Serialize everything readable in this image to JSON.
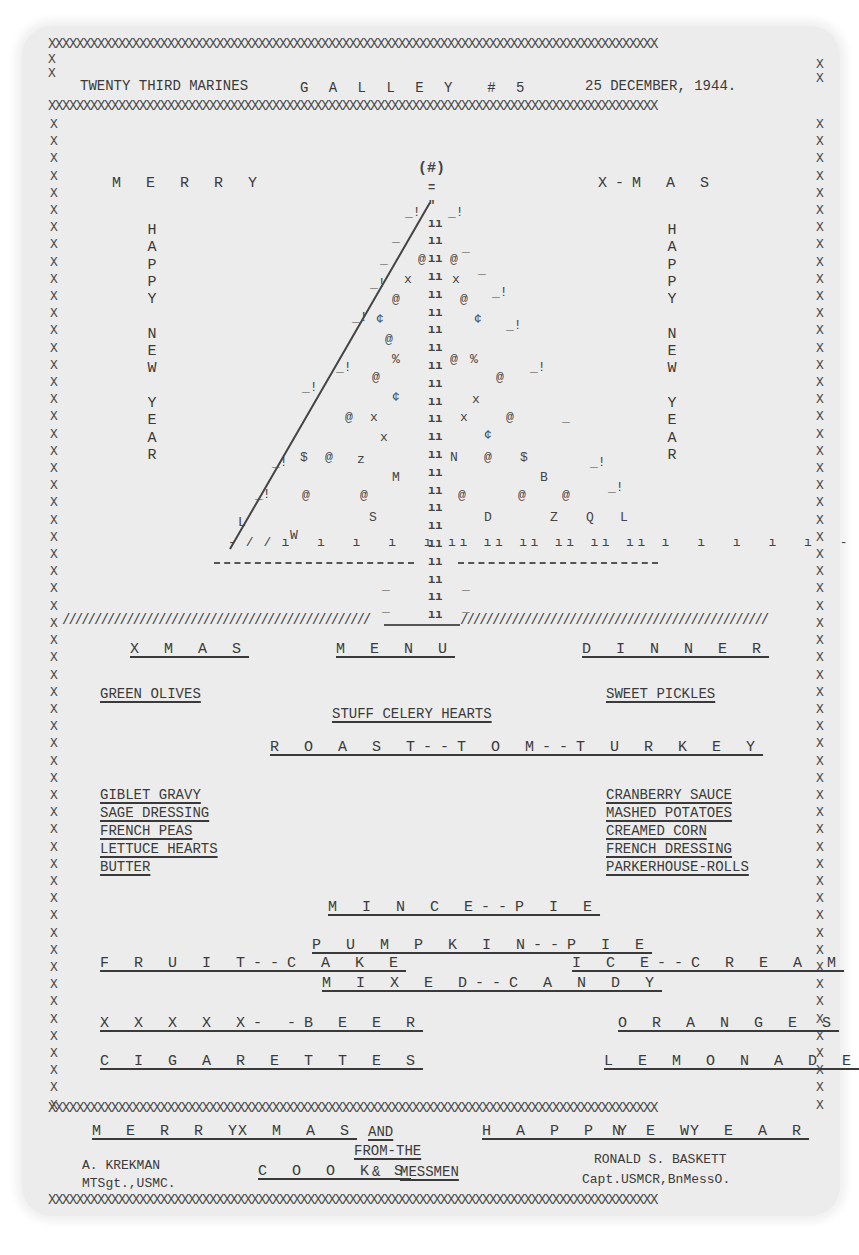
{
  "header": {
    "unit": "TWENTY THIRD MARINES",
    "galley": "G A L L E Y  # 5",
    "date": "25 DECEMBER, 1944."
  },
  "border": {
    "x_row": "XXXXXXXXXXXXXXXXXXXXXXXXXXXXXXXXXXXXXXXXXXXXXXXXXXXXXXXXXXXXXXXXXXXXXXXXXXXXXXXXXXXXXXX",
    "x_col": "X\nX\nX\nX\nX\nX\nX\nX\nX\nX\nX\nX\nX\nX\nX\nX\nX\nX\nX\nX\nX\nX\nX\nX\nX\nX\nX\nX\nX\nX\nX\nX\nX\nX\nX\nX\nX\nX\nX\nX\nX\nX\nX\nX\nX\nX\nX\nX\nX\nX\nX\nX\nX\nX\nX\nX\nX\nX",
    "hash_row_left": "////////////////////////////////////////////////",
    "hash_row_right": "////////////////////////////////////////////////"
  },
  "greeting": {
    "left_top": "M E R R Y",
    "right_top": "X-M A S",
    "left_vertical": "H\nA\nP\nP\nY\n\nN\nE\nW\n\nY\nE\nA\nR",
    "right_vertical": "H\nA\nP\nP\nY\n\nN\nE\nW\n\nY\nE\nA\nR"
  },
  "tree": {
    "star": "(#)",
    "ornaments": [
      "@",
      "x",
      "%",
      "¢",
      "$",
      "z",
      "M",
      "N",
      "B",
      "S",
      "D",
      "Z",
      "Q",
      "L",
      "W"
    ]
  },
  "menu": {
    "title": [
      "X M A S",
      "M E N U",
      "D I N N E R"
    ],
    "appetizers_left": "GREEN OLIVES",
    "appetizers_right": "SWEET PICKLES",
    "appetizers_center": "STUFF CELERY HEARTS",
    "main": "R O A S T--T O M--T U R K E Y",
    "sides_left": [
      "GIBLET GRAVY",
      "SAGE DRESSING",
      "FRENCH PEAS",
      "LETTUCE HEARTS",
      "BUTTER"
    ],
    "sides_right": [
      "CRANBERRY SAUCE",
      "MASHED POTATOES",
      "CREAMED CORN",
      "FRENCH DRESSING",
      "PARKERHOUSE-ROLLS"
    ],
    "dessert_center_1": "M I N C E--P I E",
    "dessert_center_2": "P U M P K I N--P I E",
    "dessert_left": "F R U I T--C A K E",
    "dessert_right": "I C E--C R E A M",
    "dessert_center_3": "M I X E D--C A N D Y",
    "extras_left_1": "X X X X X- -B E E R",
    "extras_right_1": "O R A N G E S",
    "extras_left_2": "C I G A R E T T E S",
    "extras_right_2": "L E M O N A D E"
  },
  "footer": {
    "greeting_1": "M E R R Y",
    "greeting_2": "X M A S",
    "greeting_and": "AND",
    "greeting_3": "H A P P Y",
    "greeting_4": "N E W",
    "greeting_5": "Y E A R",
    "from_the": "FROM-THE",
    "cooks": "C O O K S",
    "ampersand": "&",
    "messmen": "MESSMEN",
    "signer_left_name": "A. KREKMAN",
    "signer_left_rank": "MTSgt.,USMC.",
    "signer_right_name": "RONALD S. BASKETT",
    "signer_right_rank": "Capt.USMCR,BnMessO."
  }
}
